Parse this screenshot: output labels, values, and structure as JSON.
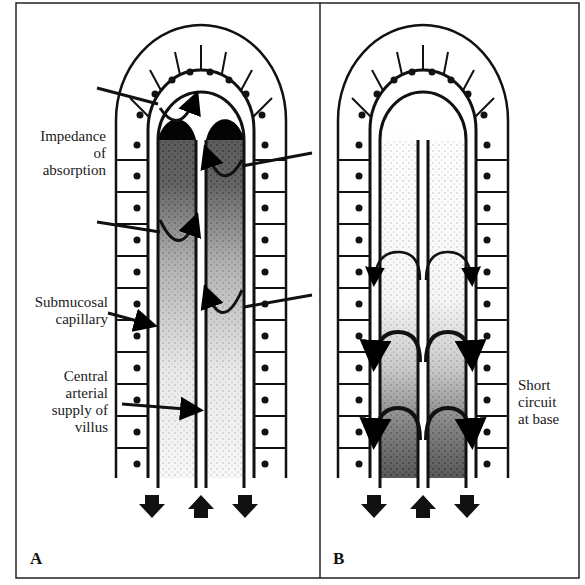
{
  "figure": {
    "panels": [
      {
        "id": "A",
        "letter": "A",
        "labels": {
          "impedance": [
            "Impedance",
            "of",
            "absorption"
          ],
          "submucosal": [
            "Submucosal",
            "capillary"
          ],
          "central": [
            "Central",
            "arterial",
            "supply of",
            "villus"
          ]
        }
      },
      {
        "id": "B",
        "letter": "B",
        "labels": {
          "short_circuit": [
            "Short",
            "circuit",
            "at base"
          ]
        }
      }
    ]
  }
}
